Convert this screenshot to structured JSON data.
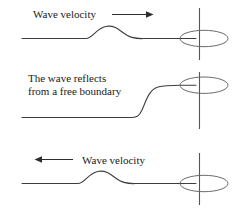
{
  "figure": {
    "width": 237,
    "height": 218,
    "background_color": "#ffffff",
    "line_color": "#3d3d3d",
    "text_color": "#1a1a1a",
    "ring_color": "#6b6b6b",
    "rod_color": "#555555"
  },
  "panels": [
    {
      "id": "panel-incident",
      "caption_lines": [
        "Wave velocity"
      ],
      "arrow": {
        "direction": "right",
        "icon": "arrow-right-icon",
        "label": "Wave velocity"
      },
      "pulse": {
        "shape": "single-hump",
        "orientation": "up",
        "position": "mid-left"
      },
      "boundary": {
        "type": "free",
        "ring_icon": "ring-ellipse-icon",
        "rod_icon": "vertical-rod-icon",
        "ring_state": "at-rest-center"
      }
    },
    {
      "id": "panel-reflecting",
      "caption_lines": [
        "The wave reflects",
        "from a free boundary"
      ],
      "arrow": null,
      "pulse": {
        "shape": "rising-step",
        "orientation": "up",
        "position": "right-end"
      },
      "boundary": {
        "type": "free",
        "ring_icon": "ring-ellipse-icon",
        "rod_icon": "vertical-rod-icon",
        "ring_state": "displaced-up"
      }
    },
    {
      "id": "panel-reflected",
      "caption_lines": [
        "Wave velocity"
      ],
      "arrow": {
        "direction": "left",
        "icon": "arrow-left-icon",
        "label": "Wave velocity"
      },
      "pulse": {
        "shape": "single-hump",
        "orientation": "up",
        "position": "mid-left"
      },
      "boundary": {
        "type": "free",
        "ring_icon": "ring-ellipse-icon",
        "rod_icon": "vertical-rod-icon",
        "ring_state": "at-rest-center"
      }
    }
  ]
}
